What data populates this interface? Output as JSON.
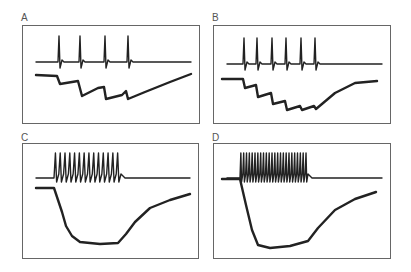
{
  "figure": {
    "panels": [
      {
        "id": "A",
        "label": "A",
        "label_pos": [
          21,
          13
        ],
        "box": [
          22,
          25,
          178,
          99
        ]
      },
      {
        "id": "B",
        "label": "B",
        "label_pos": [
          212,
          13
        ],
        "box": [
          213,
          25,
          178,
          99
        ]
      },
      {
        "id": "C",
        "label": "C",
        "label_pos": [
          21,
          133
        ],
        "box": [
          22,
          143,
          177,
          116
        ]
      },
      {
        "id": "D",
        "label": "D",
        "label_pos": [
          212,
          133
        ],
        "box": [
          213,
          143,
          178,
          116
        ]
      }
    ],
    "colors": {
      "trace": "#222222",
      "border": "#666666",
      "label": "#555555"
    }
  },
  "chart_data": [
    {
      "type": "line",
      "panel": "A",
      "title": "A",
      "description": "Upper trace: 4 spikes; lower trace: stepwise hyperpolarization with 4 steps and slow recovery",
      "spike_count": 4,
      "upper_trace_baseline_y": 62,
      "spike_x": [
        59,
        80,
        105,
        128
      ],
      "lower_trace": [
        [
          36,
          75
        ],
        [
          57,
          76
        ],
        [
          60,
          84
        ],
        [
          78,
          81
        ],
        [
          82,
          96
        ],
        [
          98,
          88
        ],
        [
          104,
          87
        ],
        [
          106,
          99
        ],
        [
          122,
          95
        ],
        [
          126,
          91
        ],
        [
          128,
          99
        ],
        [
          145,
          92
        ],
        [
          170,
          82
        ],
        [
          191,
          74
        ]
      ]
    },
    {
      "type": "line",
      "panel": "B",
      "title": "B",
      "description": "Upper trace: 6 spikes; lower trace: stepwise hyperpolarization with 6 steps and recovery",
      "spike_count": 6,
      "upper_trace_baseline_y": 64,
      "spike_x": [
        244,
        257,
        272,
        286,
        301,
        315
      ],
      "lower_trace": [
        [
          222,
          79
        ],
        [
          243,
          79
        ],
        [
          245,
          88
        ],
        [
          256,
          85
        ],
        [
          258,
          97
        ],
        [
          271,
          93
        ],
        [
          273,
          104
        ],
        [
          285,
          101
        ],
        [
          287,
          110
        ],
        [
          300,
          106
        ],
        [
          302,
          110
        ],
        [
          314,
          106
        ],
        [
          316,
          109
        ],
        [
          335,
          93
        ],
        [
          355,
          83
        ],
        [
          377,
          81
        ]
      ]
    },
    {
      "type": "line",
      "panel": "C",
      "title": "C",
      "description": "Upper trace: ~14-spike high-frequency train; lower trace: large hyperpolarization with slow recovery",
      "spike_count": 14,
      "train_start_x": 54,
      "train_end_x": 121,
      "upper_trace_baseline_y": 178,
      "lower_trace": [
        [
          36,
          188
        ],
        [
          54,
          188
        ],
        [
          58,
          200
        ],
        [
          62,
          212
        ],
        [
          66,
          226
        ],
        [
          72,
          236
        ],
        [
          80,
          242
        ],
        [
          100,
          244
        ],
        [
          118,
          243
        ],
        [
          126,
          234
        ],
        [
          135,
          222
        ],
        [
          150,
          208
        ],
        [
          170,
          200
        ],
        [
          190,
          194
        ]
      ]
    },
    {
      "type": "line",
      "panel": "D",
      "title": "D",
      "description": "Upper trace: ~24-spike high-frequency train; lower trace: rapid large hyperpolarization, plateau, and recovery",
      "spike_count": 24,
      "train_start_x": 240,
      "train_end_x": 308,
      "upper_trace_baseline_y": 178,
      "lower_trace": [
        [
          222,
          179
        ],
        [
          240,
          179
        ],
        [
          246,
          205
        ],
        [
          252,
          230
        ],
        [
          258,
          245
        ],
        [
          270,
          248
        ],
        [
          290,
          246
        ],
        [
          308,
          241
        ],
        [
          318,
          228
        ],
        [
          335,
          210
        ],
        [
          355,
          199
        ],
        [
          376,
          192
        ]
      ]
    }
  ]
}
